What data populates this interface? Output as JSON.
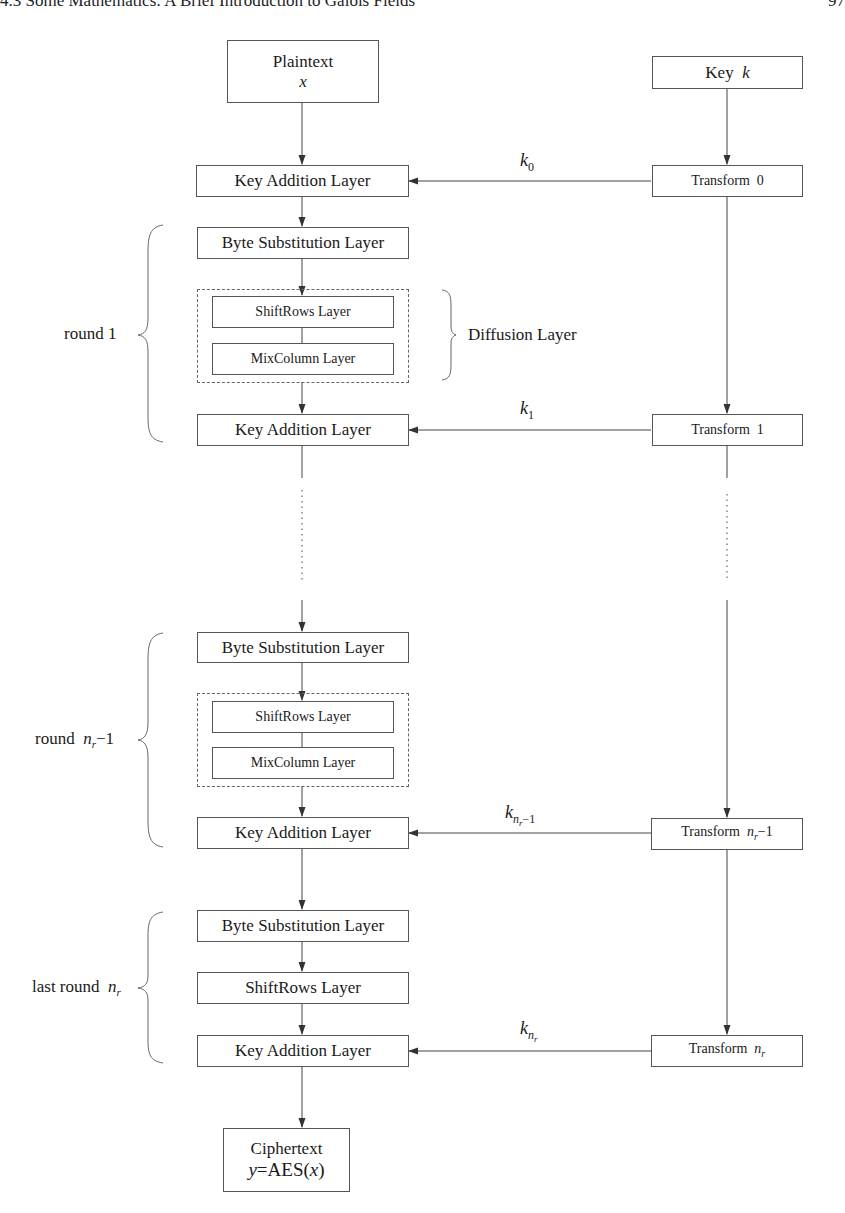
{
  "page": {
    "header": "4.3  Some Mathematics: A Brief Introduction to Galois Fields",
    "page_number": "97"
  },
  "diagram": {
    "input": {
      "label": "Plaintext",
      "var": "x"
    },
    "key": {
      "label": "Key",
      "var": "k"
    },
    "output": {
      "label": "Ciphertext",
      "formula_y": "y",
      "formula_eq": "=AES(",
      "formula_x": "x",
      "formula_close": ")"
    },
    "layers": {
      "key_addition": "Key Addition Layer",
      "byte_substitution": "Byte Substitution Layer",
      "shiftrows": "ShiftRows Layer",
      "mixcolumn": "MixColumn Layer",
      "diffusion": "Diffusion Layer"
    },
    "transforms": [
      {
        "label": "Transform",
        "index": "0"
      },
      {
        "label": "Transform",
        "index": "1"
      },
      {
        "label": "Transform",
        "index_var": "n",
        "index_sub": "r",
        "index_suffix": "−1"
      },
      {
        "label": "Transform",
        "index_var": "n",
        "index_sub": "r",
        "index_suffix": ""
      }
    ],
    "subkeys": [
      {
        "base": "k",
        "sub": "0"
      },
      {
        "base": "k",
        "sub": "1"
      },
      {
        "base": "k",
        "sub": "n",
        "subsub": "r",
        "subsuffix": "−1"
      },
      {
        "base": "k",
        "sub": "n",
        "subsub": "r",
        "subsuffix": ""
      }
    ],
    "rounds": [
      {
        "label": "round 1"
      },
      {
        "label": "round",
        "var": "n",
        "sub": "r",
        "suffix": "−1"
      },
      {
        "label": "last round",
        "var": "n",
        "sub": "r",
        "suffix": ""
      }
    ],
    "colors": {
      "line": "#444444",
      "box_border": "#555555",
      "text": "#1a1a1a"
    }
  }
}
